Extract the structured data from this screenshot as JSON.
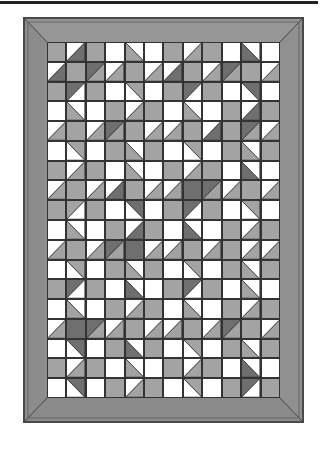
{
  "figure": {
    "grid": {
      "rows": 18,
      "cols": 12
    },
    "colors": {
      "M": "#a3a3a3",
      "D": "#6f6f6f",
      "W": "#ffffff",
      "border": "#8a8a8a",
      "border_dark": "#5a5a5a",
      "line": "#333333"
    },
    "cell_legend": {
      "M": "medium gray square",
      "D": "dark gray square",
      "W": "white square",
      "/A:B": "half-square triangle, diagonal bottom-left to top-right; A = top-left, B = bottom-right",
      "\\A:B": "half-square triangle, diagonal top-left to bottom-right; A = bottom-left, B = top-right"
    },
    "cells": [
      [
        "M",
        "/W:D",
        "M",
        "W",
        "\\M:W",
        "W",
        "M",
        "/W:M",
        "M",
        "W",
        "\\D:W",
        "W"
      ],
      [
        "/W:D",
        "M",
        "/D:M",
        "/W:M",
        "M",
        "/W:M",
        "/W:D",
        "M",
        "/W:M",
        "/D:M",
        "M",
        "/W:M"
      ],
      [
        "M",
        "/D:W",
        "M",
        "W",
        "\\W:M",
        "W",
        "M",
        "/D:W",
        "M",
        "W",
        "\\W:D",
        "W"
      ],
      [
        "W",
        "\\M:W",
        "W",
        "M",
        "/W:M",
        "M",
        "W",
        "\\M:W",
        "W",
        "M",
        "/W:D",
        "M"
      ],
      [
        "/W:M",
        "M",
        "/W:M",
        "/D:M",
        "M",
        "/W:M",
        "/W:M",
        "M",
        "/W:D",
        "M",
        "/D:M",
        "/W:M"
      ],
      [
        "W",
        "\\W:M",
        "W",
        "M",
        "\\M:W",
        "M",
        "W",
        "\\W:M",
        "W",
        "M",
        "\\M:W",
        "M"
      ],
      [
        "M",
        "/W:M",
        "M",
        "W",
        "\\M:W",
        "W",
        "M",
        "/W:M",
        "M",
        "W",
        "\\D:W",
        "W"
      ],
      [
        "/W:M",
        "M",
        "/W:M",
        "/W:D",
        "M",
        "/W:M",
        "/W:M",
        "D",
        "/D:M",
        "/W:M",
        "M",
        "/W:M"
      ],
      [
        "M",
        "/M:W",
        "M",
        "W",
        "\\W:D",
        "W",
        "M",
        "/D:W",
        "M",
        "W",
        "\\W:M",
        "W"
      ],
      [
        "W",
        "\\M:W",
        "W",
        "M",
        "/W:D",
        "M",
        "W",
        "\\D:W",
        "W",
        "M",
        "/W:M",
        "M"
      ],
      [
        "/W:M",
        "M",
        "/W:M",
        "/D:M",
        "D",
        "/W:M",
        "/W:M",
        "M",
        "/W:M",
        "M",
        "/W:M",
        "/W:M"
      ],
      [
        "W",
        "\\W:M",
        "W",
        "M",
        "\\M:W",
        "M",
        "W",
        "\\W:M",
        "W",
        "M",
        "\\M:W",
        "M"
      ],
      [
        "M",
        "/D:W",
        "M",
        "W",
        "\\D:W",
        "W",
        "M",
        "/D:W",
        "M",
        "W",
        "\\M:W",
        "W"
      ],
      [
        "W",
        "\\M:W",
        "W",
        "M",
        "/W:M",
        "M",
        "W",
        "\\M:W",
        "W",
        "M",
        "/W:M",
        "M"
      ],
      [
        "/W:M",
        "D",
        "/D:M",
        "/W:M",
        "M",
        "/W:M",
        "/W:M",
        "M",
        "/W:M",
        "/D:M",
        "M",
        "/W:M"
      ],
      [
        "W",
        "\\W:D",
        "W",
        "M",
        "\\D:W",
        "M",
        "W",
        "\\W:M",
        "W",
        "M",
        "\\M:W",
        "M"
      ],
      [
        "M",
        "/W:M",
        "M",
        "W",
        "\\M:W",
        "W",
        "M",
        "/W:M",
        "M",
        "W",
        "\\D:W",
        "W"
      ],
      [
        "W",
        "\\W:D",
        "W",
        "M",
        "/W:M",
        "M",
        "W",
        "\\W:M",
        "W",
        "M",
        "/D:W",
        "M"
      ]
    ]
  }
}
